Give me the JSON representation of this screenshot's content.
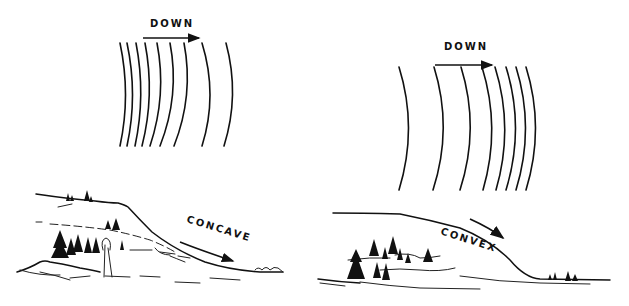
{
  "colors": {
    "ink": "#111111",
    "background": "#ffffff"
  },
  "left_panel": {
    "direction_label": "DOWN",
    "slope_label": "CONCAVE",
    "contour_count": 9,
    "contours": [
      {
        "x_top": 120,
        "x_bottom": 120
      },
      {
        "x_top": 127,
        "x_bottom": 127
      },
      {
        "x_top": 136,
        "x_bottom": 135
      },
      {
        "x_top": 145,
        "x_bottom": 142
      },
      {
        "x_top": 157,
        "x_bottom": 150
      },
      {
        "x_top": 170,
        "x_bottom": 160
      },
      {
        "x_top": 184,
        "x_bottom": 174
      },
      {
        "x_top": 202,
        "x_bottom": 202
      },
      {
        "x_top": 226,
        "x_bottom": 224
      }
    ]
  },
  "right_panel": {
    "direction_label": "DOWN",
    "slope_label": "CONVEX",
    "contour_count": 8,
    "contours": [
      {
        "x_top": 399,
        "x_bottom": 399
      },
      {
        "x_top": 434,
        "x_bottom": 433
      },
      {
        "x_top": 461,
        "x_bottom": 460
      },
      {
        "x_top": 482,
        "x_bottom": 483
      },
      {
        "x_top": 495,
        "x_bottom": 496
      },
      {
        "x_top": 506,
        "x_bottom": 506
      },
      {
        "x_top": 516,
        "x_bottom": 516
      },
      {
        "x_top": 526,
        "x_bottom": 526
      }
    ]
  }
}
